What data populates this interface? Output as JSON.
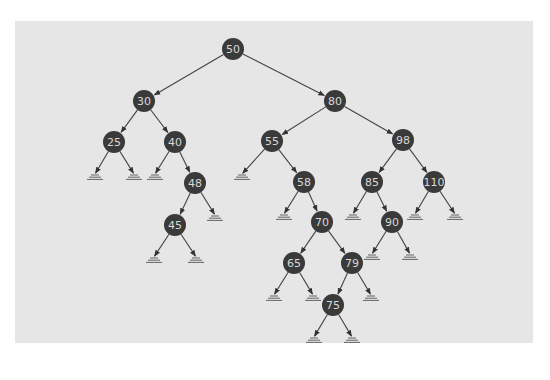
{
  "diagram": {
    "type": "binary-search-tree",
    "colors": {
      "background": "#ffffff",
      "panel": "#e6e6e6",
      "node_fill": "#3a3a3a",
      "node_text": "#d8d8d8",
      "edge": "#444444",
      "null_marker": "#555555"
    },
    "node_radius": 11,
    "nodes": [
      {
        "id": "n50",
        "label": "50",
        "x": 233,
        "y": 49
      },
      {
        "id": "n30",
        "label": "30",
        "x": 144,
        "y": 101
      },
      {
        "id": "n80",
        "label": "80",
        "x": 335,
        "y": 101
      },
      {
        "id": "n25",
        "label": "25",
        "x": 114,
        "y": 142
      },
      {
        "id": "n40",
        "label": "40",
        "x": 175,
        "y": 142
      },
      {
        "id": "n55",
        "label": "55",
        "x": 272,
        "y": 141
      },
      {
        "id": "n98",
        "label": "98",
        "x": 403,
        "y": 140
      },
      {
        "id": "n48",
        "label": "48",
        "x": 195,
        "y": 183
      },
      {
        "id": "n58",
        "label": "58",
        "x": 304,
        "y": 182
      },
      {
        "id": "n85",
        "label": "85",
        "x": 372,
        "y": 182
      },
      {
        "id": "n110",
        "label": "110",
        "x": 434,
        "y": 182
      },
      {
        "id": "n45",
        "label": "45",
        "x": 175,
        "y": 225
      },
      {
        "id": "n70",
        "label": "70",
        "x": 322,
        "y": 222
      },
      {
        "id": "n90",
        "label": "90",
        "x": 392,
        "y": 222
      },
      {
        "id": "n65",
        "label": "65",
        "x": 294,
        "y": 263
      },
      {
        "id": "n79",
        "label": "79",
        "x": 352,
        "y": 263
      },
      {
        "id": "n75",
        "label": "75",
        "x": 333,
        "y": 305
      }
    ],
    "edges": [
      {
        "from": "n50",
        "to": "n30"
      },
      {
        "from": "n50",
        "to": "n80"
      },
      {
        "from": "n30",
        "to": "n25"
      },
      {
        "from": "n30",
        "to": "n40"
      },
      {
        "from": "n80",
        "to": "n55"
      },
      {
        "from": "n80",
        "to": "n98"
      },
      {
        "from": "n40",
        "to": "n48"
      },
      {
        "from": "n55",
        "to": "n58"
      },
      {
        "from": "n98",
        "to": "n85"
      },
      {
        "from": "n98",
        "to": "n110"
      },
      {
        "from": "n48",
        "to": "n45"
      },
      {
        "from": "n58",
        "to": "n70"
      },
      {
        "from": "n85",
        "to": "n90"
      },
      {
        "from": "n70",
        "to": "n65"
      },
      {
        "from": "n70",
        "to": "n79"
      },
      {
        "from": "n79",
        "to": "n75"
      }
    ],
    "null_leaves": [
      {
        "parent": "n25",
        "x": 95,
        "y": 177
      },
      {
        "parent": "n25",
        "x": 134,
        "y": 177
      },
      {
        "parent": "n40",
        "x": 155,
        "y": 177
      },
      {
        "parent": "n55",
        "x": 242,
        "y": 177
      },
      {
        "parent": "n48",
        "x": 215,
        "y": 218
      },
      {
        "parent": "n58",
        "x": 284,
        "y": 217
      },
      {
        "parent": "n85",
        "x": 353,
        "y": 217
      },
      {
        "parent": "n110",
        "x": 415,
        "y": 217
      },
      {
        "parent": "n110",
        "x": 455,
        "y": 217
      },
      {
        "parent": "n45",
        "x": 154,
        "y": 260
      },
      {
        "parent": "n45",
        "x": 196,
        "y": 260
      },
      {
        "parent": "n90",
        "x": 372,
        "y": 257
      },
      {
        "parent": "n90",
        "x": 410,
        "y": 257
      },
      {
        "parent": "n65",
        "x": 274,
        "y": 298
      },
      {
        "parent": "n65",
        "x": 313,
        "y": 298
      },
      {
        "parent": "n79",
        "x": 371,
        "y": 298
      },
      {
        "parent": "n75",
        "x": 314,
        "y": 340
      },
      {
        "parent": "n75",
        "x": 352,
        "y": 340
      }
    ]
  }
}
